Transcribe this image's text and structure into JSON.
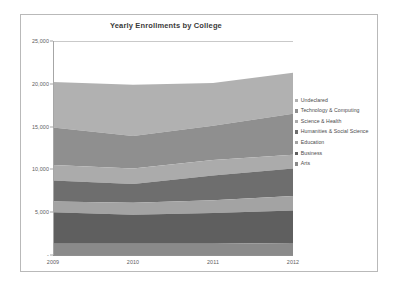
{
  "chart": {
    "title": "Yearly Enrollments by College",
    "frame_border_color": "#b9b9b9",
    "background": "#ffffff"
  },
  "axes": {
    "y_ticks": [
      "25,000",
      "20,000",
      "15,000",
      "10,000",
      "5,000",
      "-"
    ],
    "x_ticks": [
      "2009",
      "2010",
      "2011",
      "2012"
    ]
  },
  "legend": {
    "items": [
      {
        "label": "Undeclared",
        "color": "#b1b1b1"
      },
      {
        "label": "Technology & Computing",
        "color": "#8f8f8f"
      },
      {
        "label": "Science & Health",
        "color": "#ababab"
      },
      {
        "label": "Humanities & Social Science",
        "color": "#6e6e6e"
      },
      {
        "label": "Education",
        "color": "#a3a3a3"
      },
      {
        "label": "Business",
        "color": "#5f5f5f"
      },
      {
        "label": "Arts",
        "color": "#8a8a8a"
      }
    ]
  },
  "chart_data": {
    "type": "area",
    "title": "Yearly Enrollments by College",
    "xlabel": "",
    "ylabel": "",
    "x": [
      "2009",
      "2010",
      "2011",
      "2012"
    ],
    "ylim": [
      0,
      25000
    ],
    "y_tick_values": [
      0,
      5000,
      10000,
      15000,
      20000,
      25000
    ],
    "grid": false,
    "stacked": true,
    "legend_position": "right",
    "stack_order_bottom_to_top": [
      "Arts",
      "Business",
      "Education",
      "Humanities & Social Science",
      "Science & Health",
      "Technology & Computing",
      "Undeclared"
    ],
    "series": [
      {
        "name": "Arts",
        "color": "#8a8a8a",
        "values": [
          1300,
          1300,
          1300,
          1400
        ]
      },
      {
        "name": "Business",
        "color": "#5f5f5f",
        "values": [
          3700,
          3400,
          3600,
          3800
        ]
      },
      {
        "name": "Education",
        "color": "#a3a3a3",
        "values": [
          1250,
          1400,
          1500,
          1700
        ]
      },
      {
        "name": "Humanities & Social Science",
        "color": "#6e6e6e",
        "values": [
          2450,
          2200,
          2900,
          3200
        ]
      },
      {
        "name": "Science & Health",
        "color": "#ababab",
        "values": [
          1800,
          1800,
          1800,
          1600
        ]
      },
      {
        "name": "Technology & Computing",
        "color": "#8f8f8f",
        "values": [
          4400,
          3800,
          4000,
          4800
        ]
      },
      {
        "name": "Undeclared",
        "color": "#b1b1b1",
        "values": [
          5300,
          6000,
          5000,
          4800
        ]
      }
    ],
    "cumulative_totals": [
      20200,
      19900,
      20100,
      21300
    ]
  }
}
